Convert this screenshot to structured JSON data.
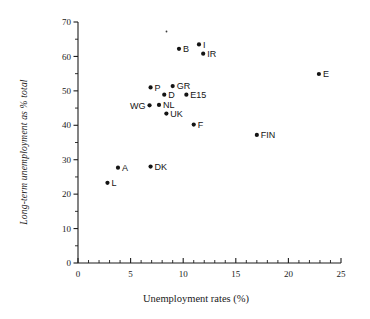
{
  "figure": {
    "background": "#ffffff",
    "marker_color": "#141414",
    "axis_color": "#1d1d1d"
  },
  "chart_data": {
    "type": "scatter",
    "title": "",
    "xlabel": "Unemployment rates (%)",
    "ylabel": "Long-term unemployment as % total",
    "xlim": [
      0,
      25
    ],
    "ylim": [
      0,
      70
    ],
    "xticks": [
      0,
      5,
      10,
      15,
      20,
      25
    ],
    "yticks": [
      0,
      10,
      20,
      30,
      40,
      50,
      60,
      70
    ],
    "xtick_labels": [
      "0",
      "5",
      "10",
      "15",
      "20",
      "25"
    ],
    "ytick_labels": [
      "0",
      "10",
      "20",
      "30",
      "40",
      "50",
      "60",
      "70"
    ],
    "x_minor_tick_interval": 1,
    "y_minor_tick_interval": 5,
    "grid": false,
    "legend": false,
    "points": [
      {
        "label": "L",
        "x": 2.8,
        "y": 23.3,
        "label_pos": "right"
      },
      {
        "label": "A",
        "x": 3.8,
        "y": 27.7,
        "label_pos": "right"
      },
      {
        "label": "DK",
        "x": 6.9,
        "y": 28.0,
        "label_pos": "right"
      },
      {
        "label": "WG",
        "x": 6.8,
        "y": 45.8,
        "label_pos": "left"
      },
      {
        "label": "P",
        "x": 6.9,
        "y": 51.0,
        "label_pos": "right"
      },
      {
        "label": "NL",
        "x": 7.7,
        "y": 45.9,
        "label_pos": "right"
      },
      {
        "label": "D",
        "x": 8.2,
        "y": 48.9,
        "label_pos": "right"
      },
      {
        "label": "UK",
        "x": 8.4,
        "y": 43.4,
        "label_pos": "right"
      },
      {
        "label": "GR",
        "x": 9.0,
        "y": 51.4,
        "label_pos": "right"
      },
      {
        "label": "B",
        "x": 9.6,
        "y": 62.2,
        "label_pos": "right"
      },
      {
        "label": "E15",
        "x": 10.3,
        "y": 48.9,
        "label_pos": "right"
      },
      {
        "label": "F",
        "x": 11.0,
        "y": 40.2,
        "label_pos": "right"
      },
      {
        "label": "I",
        "x": 11.5,
        "y": 63.5,
        "label_pos": "right"
      },
      {
        "label": "IR",
        "x": 11.9,
        "y": 60.8,
        "label_pos": "right"
      },
      {
        "label": "FIN",
        "x": 17.0,
        "y": 37.2,
        "label_pos": "right"
      },
      {
        "label": "E",
        "x": 22.9,
        "y": 54.9,
        "label_pos": "right"
      }
    ]
  }
}
